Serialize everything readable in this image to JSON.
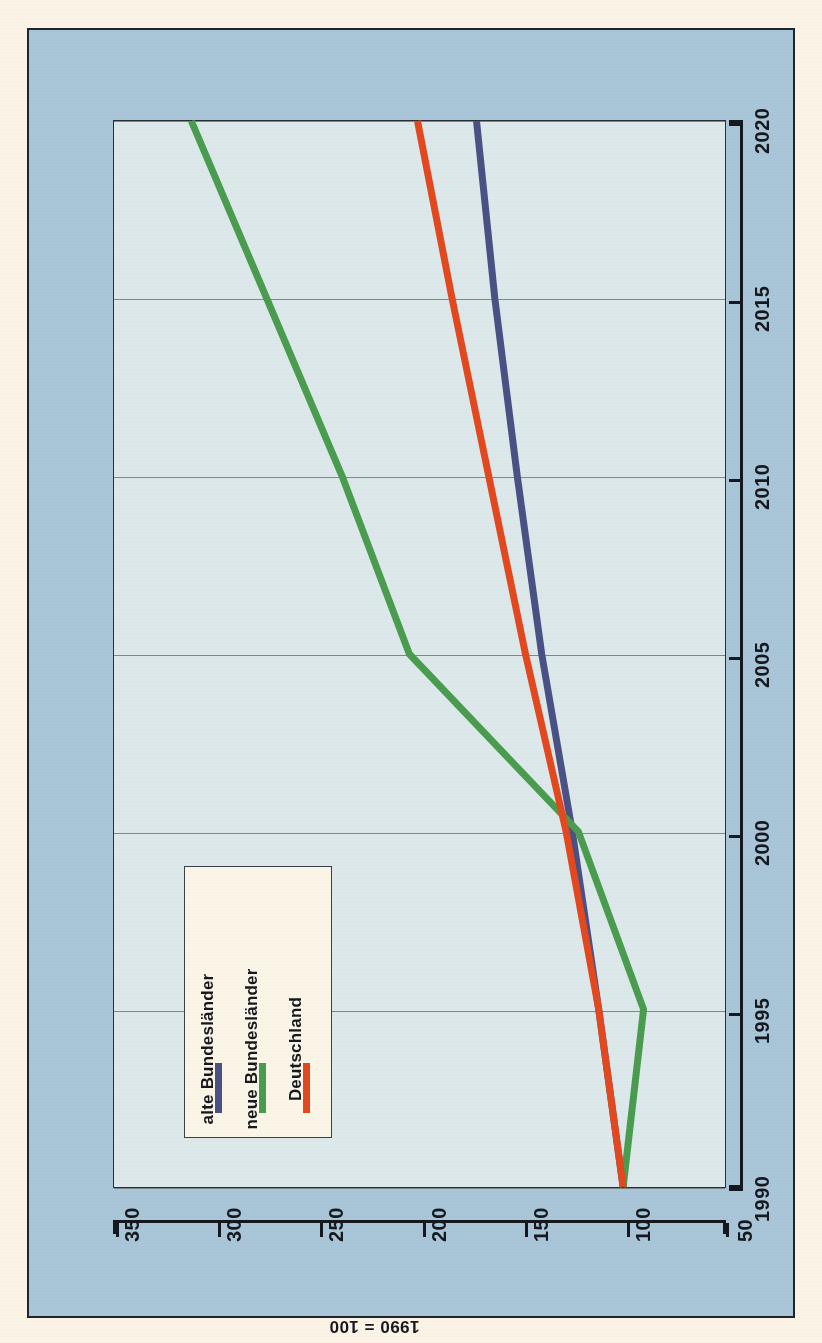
{
  "chart_data": {
    "type": "line",
    "title": "",
    "xlabel": "",
    "ylabel": "1990 = 100",
    "orientation": "rotated-90",
    "grid": true,
    "legend_position": "inside-lower-left",
    "x": [
      1990,
      1995,
      2000,
      2005,
      2010,
      2015,
      2020
    ],
    "xlim": [
      1990,
      2020
    ],
    "ylim": [
      50,
      350
    ],
    "x_ticklabels": [
      "1990",
      "1995",
      "2000",
      "2005",
      "2010",
      "2015",
      "2020"
    ],
    "y_ticklabels": [
      "350",
      "300",
      "250",
      "200",
      "150",
      "100",
      "50"
    ],
    "y_ticks": [
      350,
      300,
      250,
      200,
      150,
      100,
      50
    ],
    "series": [
      {
        "name": "alte Bundesländer",
        "color": "#4a5184",
        "values": [
          100,
          112,
          125,
          140,
          152,
          163,
          172
        ]
      },
      {
        "name": "neue Bundesländer",
        "color": "#4a9c4f",
        "values": [
          100,
          90,
          122,
          205,
          238,
          275,
          312
        ]
      },
      {
        "name": "Deutschland",
        "color": "#e4481f",
        "values": [
          100,
          112,
          128,
          148,
          166,
          184,
          201
        ]
      }
    ]
  },
  "legend": {
    "items": [
      {
        "label": "alte Bundesländer",
        "color": "#4a5184"
      },
      {
        "label": "neue Bundesländer",
        "color": "#4a9c4f"
      },
      {
        "label": "Deutschland",
        "color": "#e4481f"
      }
    ]
  },
  "axes": {
    "y_axis_title": "1990 = 100",
    "y_ticklabels": [
      "350",
      "300",
      "250",
      "200",
      "150",
      "100",
      "50"
    ],
    "x_ticklabels": [
      "1990",
      "1995",
      "2000",
      "2005",
      "2010",
      "2015",
      "2020"
    ]
  },
  "colors": {
    "page_background": "#faf3e6",
    "frame_background": "#a9c6d8",
    "plot_background": "#dce8ea",
    "axis": "#15181d",
    "grid": "#6d7780",
    "legend_background": "#fbf5e8"
  }
}
